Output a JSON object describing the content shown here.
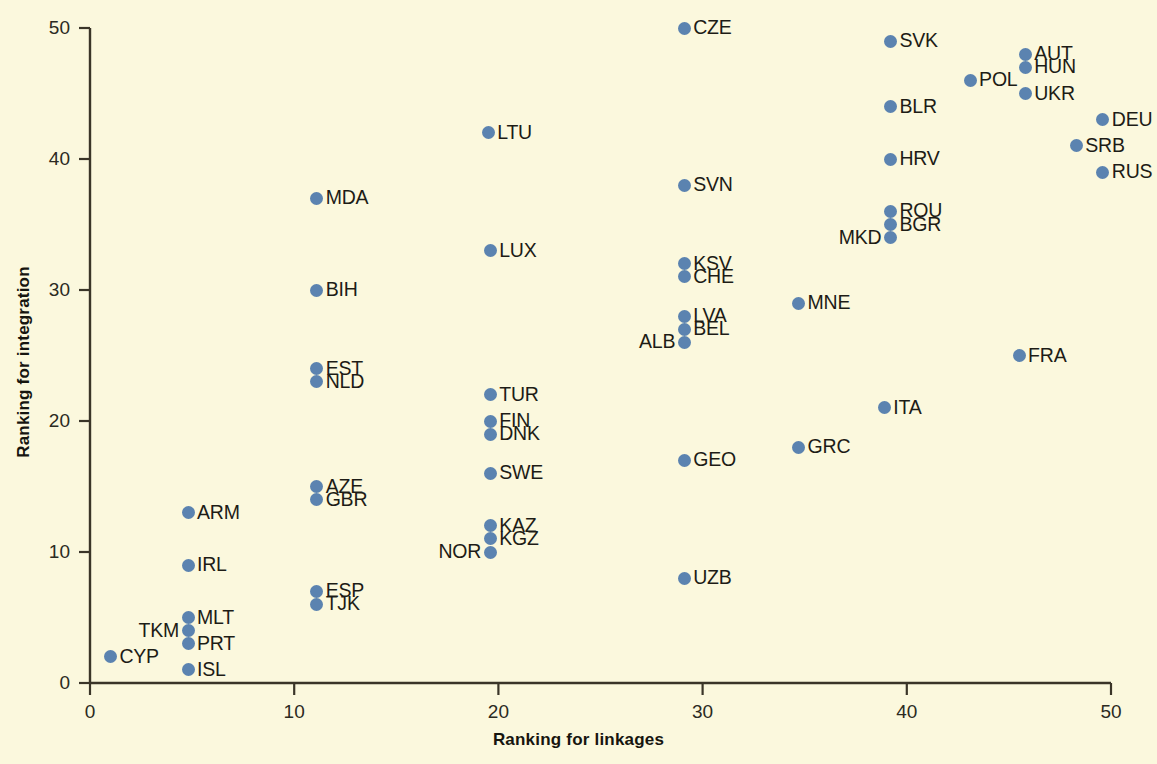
{
  "chart_data": {
    "type": "scatter",
    "title": "",
    "xlabel": "Ranking for linkages",
    "ylabel": "Ranking for integration",
    "xlim": [
      0,
      50
    ],
    "ylim": [
      0,
      50
    ],
    "xticks": [
      0,
      10,
      20,
      30,
      40,
      50
    ],
    "yticks": [
      0,
      10,
      20,
      30,
      40,
      50
    ],
    "grid": false,
    "legend": null,
    "point_color": "#5b83b0",
    "background_color": "#fbf8dd",
    "axis_color": "#3a3528",
    "points": [
      {
        "label": "CYP",
        "x": 1,
        "y": 2,
        "side": "right"
      },
      {
        "label": "ISL",
        "x": 4.8,
        "y": 1,
        "side": "right"
      },
      {
        "label": "PRT",
        "x": 4.8,
        "y": 3,
        "side": "right"
      },
      {
        "label": "TKM",
        "x": 4.8,
        "y": 4,
        "side": "left"
      },
      {
        "label": "MLT",
        "x": 4.8,
        "y": 5,
        "side": "right"
      },
      {
        "label": "IRL",
        "x": 4.8,
        "y": 9,
        "side": "right"
      },
      {
        "label": "ARM",
        "x": 4.8,
        "y": 13,
        "side": "right"
      },
      {
        "label": "TJK",
        "x": 11.1,
        "y": 6,
        "side": "right"
      },
      {
        "label": "ESP",
        "x": 11.1,
        "y": 7,
        "side": "right"
      },
      {
        "label": "GBR",
        "x": 11.1,
        "y": 14,
        "side": "right"
      },
      {
        "label": "AZE",
        "x": 11.1,
        "y": 15,
        "side": "right"
      },
      {
        "label": "NLD",
        "x": 11.1,
        "y": 23,
        "side": "right"
      },
      {
        "label": "EST",
        "x": 11.1,
        "y": 24,
        "side": "right"
      },
      {
        "label": "BIH",
        "x": 11.1,
        "y": 30,
        "side": "right"
      },
      {
        "label": "MDA",
        "x": 11.1,
        "y": 37,
        "side": "right"
      },
      {
        "label": "NOR",
        "x": 19.6,
        "y": 10,
        "side": "left"
      },
      {
        "label": "KGZ",
        "x": 19.6,
        "y": 11,
        "side": "right"
      },
      {
        "label": "KAZ",
        "x": 19.6,
        "y": 12,
        "side": "right"
      },
      {
        "label": "SWE",
        "x": 19.6,
        "y": 16,
        "side": "right"
      },
      {
        "label": "DNK",
        "x": 19.6,
        "y": 19,
        "side": "right"
      },
      {
        "label": "FIN",
        "x": 19.6,
        "y": 20,
        "side": "right"
      },
      {
        "label": "TUR",
        "x": 19.6,
        "y": 22,
        "side": "right"
      },
      {
        "label": "LUX",
        "x": 19.6,
        "y": 33,
        "side": "right"
      },
      {
        "label": "LTU",
        "x": 19.5,
        "y": 42,
        "side": "right"
      },
      {
        "label": "UZB",
        "x": 29.1,
        "y": 8,
        "side": "right"
      },
      {
        "label": "GEO",
        "x": 29.1,
        "y": 17,
        "side": "right"
      },
      {
        "label": "ALB",
        "x": 29.1,
        "y": 26,
        "side": "left"
      },
      {
        "label": "BEL",
        "x": 29.1,
        "y": 27,
        "side": "right"
      },
      {
        "label": "LVA",
        "x": 29.1,
        "y": 28,
        "side": "right"
      },
      {
        "label": "CHE",
        "x": 29.1,
        "y": 31,
        "side": "right"
      },
      {
        "label": "KSV",
        "x": 29.1,
        "y": 32,
        "side": "right"
      },
      {
        "label": "SVN",
        "x": 29.1,
        "y": 38,
        "side": "right"
      },
      {
        "label": "CZE",
        "x": 29.1,
        "y": 50,
        "side": "right"
      },
      {
        "label": "GRC",
        "x": 34.7,
        "y": 18,
        "side": "right"
      },
      {
        "label": "MNE",
        "x": 34.7,
        "y": 29,
        "side": "right"
      },
      {
        "label": "ITA",
        "x": 38.9,
        "y": 21,
        "side": "right"
      },
      {
        "label": "MKD",
        "x": 39.2,
        "y": 34,
        "side": "left"
      },
      {
        "label": "BGR",
        "x": 39.2,
        "y": 35,
        "side": "right"
      },
      {
        "label": "ROU",
        "x": 39.2,
        "y": 36,
        "side": "right"
      },
      {
        "label": "HRV",
        "x": 39.2,
        "y": 40,
        "side": "right"
      },
      {
        "label": "BLR",
        "x": 39.2,
        "y": 44,
        "side": "right"
      },
      {
        "label": "SVK",
        "x": 39.2,
        "y": 49,
        "side": "right"
      },
      {
        "label": "POL",
        "x": 43.1,
        "y": 46,
        "side": "right"
      },
      {
        "label": "FRA",
        "x": 45.5,
        "y": 25,
        "side": "right"
      },
      {
        "label": "UKR",
        "x": 45.8,
        "y": 45,
        "side": "right"
      },
      {
        "label": "HUN",
        "x": 45.8,
        "y": 47,
        "side": "right"
      },
      {
        "label": "AUT",
        "x": 45.8,
        "y": 48,
        "side": "right"
      },
      {
        "label": "RUS",
        "x": 49.6,
        "y": 39,
        "side": "right"
      },
      {
        "label": "SRB",
        "x": 48.3,
        "y": 41,
        "side": "right"
      },
      {
        "label": "DEU",
        "x": 49.6,
        "y": 43,
        "side": "right"
      }
    ]
  },
  "axes": {
    "x_title": "Ranking for linkages",
    "y_title": "Ranking for integration",
    "x_tick_labels": [
      "0",
      "10",
      "20",
      "30",
      "40",
      "50"
    ],
    "y_tick_labels": [
      "0",
      "10",
      "20",
      "30",
      "40",
      "50"
    ]
  }
}
